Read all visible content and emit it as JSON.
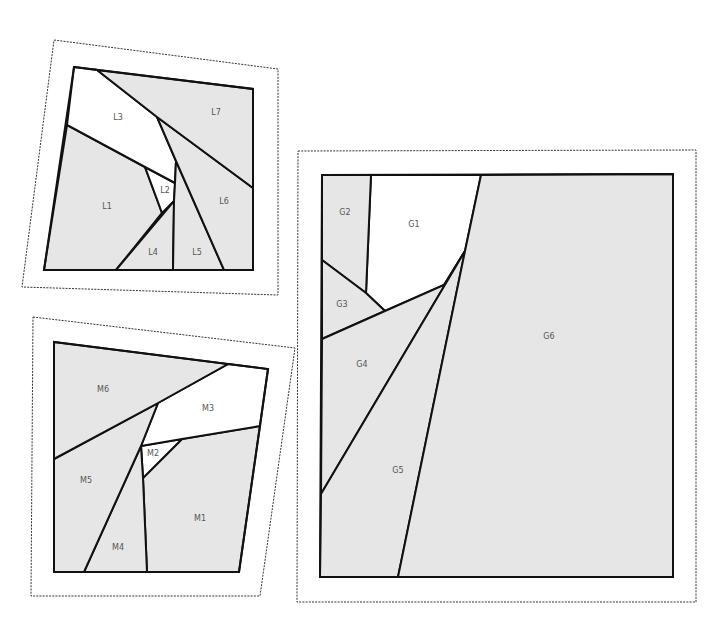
{
  "colors": {
    "shaded": "#e6e6e6",
    "unshaded": "#ffffff",
    "stroke": "#111111",
    "label": "#555555",
    "outline": "#333333"
  },
  "blocks": [
    {
      "id": "L",
      "name": "block-l",
      "outline": [
        [
          54,
          40
        ],
        [
          278,
          69
        ],
        [
          278,
          295
        ],
        [
          22,
          287
        ]
      ],
      "frame": [
        [
          74,
          67
        ],
        [
          253,
          89
        ],
        [
          253,
          270
        ],
        [
          44,
          270
        ]
      ],
      "pieces": [
        {
          "label": "L1",
          "shaded": true,
          "points": [
            [
              67,
              125
            ],
            [
              145,
              167
            ],
            [
              162,
              213
            ],
            [
              116,
              270
            ],
            [
              44,
              270
            ]
          ],
          "label_pos": [
            107,
            206
          ]
        },
        {
          "label": "L2",
          "shaded": false,
          "points": [
            [
              145,
              167
            ],
            [
              175,
              183
            ],
            [
              174,
              201
            ],
            [
              162,
              213
            ]
          ],
          "label_pos": [
            165,
            190
          ]
        },
        {
          "label": "L3",
          "shaded": false,
          "points": [
            [
              74,
              67
            ],
            [
              97,
              70
            ],
            [
              157,
              117
            ],
            [
              176,
              161
            ],
            [
              175,
              183
            ],
            [
              145,
              167
            ],
            [
              67,
              125
            ]
          ],
          "label_pos": [
            118,
            117
          ]
        },
        {
          "label": "L4",
          "shaded": true,
          "points": [
            [
              116,
              270
            ],
            [
              174,
              201
            ],
            [
              173,
              270
            ]
          ],
          "label_pos": [
            153,
            252
          ]
        },
        {
          "label": "L5",
          "shaded": true,
          "points": [
            [
              176,
              161
            ],
            [
              224,
              270
            ],
            [
              173,
              270
            ],
            [
              174,
              201
            ],
            [
              175,
              183
            ]
          ],
          "label_pos": [
            197,
            252
          ]
        },
        {
          "label": "L6",
          "shaded": true,
          "points": [
            [
              157,
              117
            ],
            [
              253,
              188
            ],
            [
              253,
              270
            ],
            [
              224,
              270
            ],
            [
              176,
              161
            ]
          ],
          "label_pos": [
            224,
            201
          ]
        },
        {
          "label": "L7",
          "shaded": true,
          "points": [
            [
              97,
              70
            ],
            [
              253,
              89
            ],
            [
              253,
              188
            ],
            [
              157,
              117
            ]
          ],
          "label_pos": [
            216,
            112
          ]
        }
      ]
    },
    {
      "id": "M",
      "name": "block-m",
      "outline": [
        [
          33,
          317
        ],
        [
          295,
          348
        ],
        [
          260,
          596
        ],
        [
          31,
          596
        ]
      ],
      "frame": [
        [
          54,
          342
        ],
        [
          268,
          369
        ],
        [
          239,
          572
        ],
        [
          54,
          572
        ]
      ],
      "pieces": [
        {
          "label": "M1",
          "shaded": true,
          "points": [
            [
              182,
              439
            ],
            [
              260,
              426
            ],
            [
              239,
              572
            ],
            [
              147,
              572
            ],
            [
              143,
              478
            ]
          ],
          "label_pos": [
            200,
            518
          ]
        },
        {
          "label": "M2",
          "shaded": false,
          "points": [
            [
              141,
              446
            ],
            [
              182,
              439
            ],
            [
              143,
              478
            ]
          ],
          "label_pos": [
            153,
            453
          ]
        },
        {
          "label": "M3",
          "shaded": false,
          "points": [
            [
              228,
              364
            ],
            [
              268,
              369
            ],
            [
              260,
              426
            ],
            [
              182,
              439
            ],
            [
              141,
              446
            ],
            [
              158,
              403
            ]
          ],
          "label_pos": [
            208,
            408
          ]
        },
        {
          "label": "M4",
          "shaded": true,
          "points": [
            [
              141,
              446
            ],
            [
              143,
              478
            ],
            [
              147,
              572
            ],
            [
              84,
              572
            ]
          ],
          "label_pos": [
            118,
            547
          ]
        },
        {
          "label": "M5",
          "shaded": true,
          "points": [
            [
              54,
              459
            ],
            [
              158,
              403
            ],
            [
              141,
              446
            ],
            [
              84,
              572
            ],
            [
              54,
              572
            ]
          ],
          "label_pos": [
            86,
            480
          ]
        },
        {
          "label": "M6",
          "shaded": true,
          "points": [
            [
              54,
              342
            ],
            [
              228,
              364
            ],
            [
              158,
              403
            ],
            [
              54,
              459
            ]
          ],
          "label_pos": [
            103,
            389
          ]
        }
      ]
    },
    {
      "id": "G",
      "name": "block-g",
      "outline": [
        [
          298,
          151
        ],
        [
          696,
          150
        ],
        [
          696,
          602
        ],
        [
          297,
          602
        ]
      ],
      "frame": [
        [
          322,
          175
        ],
        [
          673,
          174
        ],
        [
          673,
          577
        ],
        [
          320,
          577
        ]
      ],
      "pieces": [
        {
          "label": "G1",
          "shaded": false,
          "points": [
            [
              371,
              175
            ],
            [
              481,
              175
            ],
            [
              465,
              251
            ],
            [
              444,
              285
            ],
            [
              385,
              311
            ],
            [
              366,
              293
            ]
          ],
          "label_pos": [
            414,
            224
          ]
        },
        {
          "label": "G2",
          "shaded": true,
          "points": [
            [
              322,
              175
            ],
            [
              371,
              175
            ],
            [
              366,
              293
            ],
            [
              322,
              260
            ]
          ],
          "label_pos": [
            345,
            212
          ]
        },
        {
          "label": "G3",
          "shaded": true,
          "points": [
            [
              322,
              260
            ],
            [
              366,
              293
            ],
            [
              385,
              311
            ],
            [
              322,
              339
            ]
          ],
          "label_pos": [
            342,
            304
          ]
        },
        {
          "label": "G4",
          "shaded": true,
          "points": [
            [
              322,
              339
            ],
            [
              385,
              311
            ],
            [
              444,
              285
            ],
            [
              465,
              251
            ],
            [
              321,
              494
            ]
          ],
          "label_pos": [
            362,
            364
          ]
        },
        {
          "label": "G5",
          "shaded": true,
          "points": [
            [
              321,
              494
            ],
            [
              465,
              251
            ],
            [
              398,
              577
            ],
            [
              320,
              577
            ]
          ],
          "label_pos": [
            398,
            470
          ]
        },
        {
          "label": "G6",
          "shaded": true,
          "points": [
            [
              481,
              175
            ],
            [
              673,
              174
            ],
            [
              673,
              577
            ],
            [
              398,
              577
            ],
            [
              465,
              251
            ]
          ],
          "label_pos": [
            549,
            336
          ]
        }
      ]
    }
  ]
}
